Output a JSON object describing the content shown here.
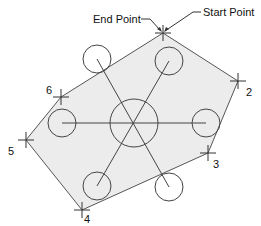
{
  "diagram": {
    "type": "polyline-boundary-with-circles",
    "colors": {
      "fill": "#ececec",
      "stroke": "#555555",
      "text": "#111111",
      "background": "#ffffff"
    },
    "annotations": {
      "end_point": "End Point",
      "start_point": "Start Point"
    },
    "vertices": [
      {
        "id": "start",
        "label": "",
        "x": 163,
        "y": 33
      },
      {
        "id": "2",
        "label": "2",
        "x": 238,
        "y": 81
      },
      {
        "id": "3",
        "label": "3",
        "x": 208,
        "y": 153
      },
      {
        "id": "4",
        "label": "4",
        "x": 82,
        "y": 210
      },
      {
        "id": "5",
        "label": "5",
        "x": 26,
        "y": 140
      },
      {
        "id": "6",
        "label": "6",
        "x": 61,
        "y": 97
      }
    ],
    "center_circle": {
      "cx": 134,
      "cy": 123,
      "r": 24
    },
    "small_circles": [
      {
        "cx": 97,
        "cy": 59,
        "r": 14
      },
      {
        "cx": 169,
        "cy": 61,
        "r": 14
      },
      {
        "cx": 206,
        "cy": 123,
        "r": 14
      },
      {
        "cx": 62,
        "cy": 123,
        "r": 14
      },
      {
        "cx": 97,
        "cy": 186,
        "r": 14
      },
      {
        "cx": 169,
        "cy": 187,
        "r": 14
      }
    ]
  }
}
